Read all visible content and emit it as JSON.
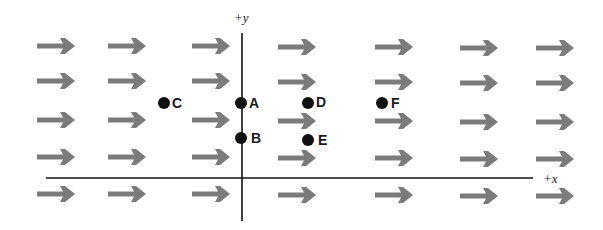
{
  "figure": {
    "axes": {
      "x_label": "+x",
      "y_label": "+y",
      "x_axis": {
        "x1": 46,
        "x2": 533,
        "y": 178
      },
      "y_axis": {
        "x": 242,
        "y1": 33,
        "y2": 221
      },
      "color": "#111111"
    },
    "field": {
      "direction": "+x",
      "arrow_color": "#7b7b7b",
      "arrow_length": 38,
      "columns_x": [
        37,
        108,
        192,
        278,
        375,
        460,
        536
      ],
      "rows_y": [
        46,
        81,
        120,
        157,
        194
      ],
      "column_y_offset": [
        0,
        0,
        0,
        1,
        1,
        2,
        2
      ]
    },
    "points": [
      {
        "label": "A",
        "x": 241,
        "y": 103,
        "label_dx": 8,
        "label_dy": 5
      },
      {
        "label": "B",
        "x": 241,
        "y": 138,
        "label_dx": 10,
        "label_dy": 5
      },
      {
        "label": "C",
        "x": 164,
        "y": 103,
        "label_dx": 8,
        "label_dy": 5
      },
      {
        "label": "D",
        "x": 308,
        "y": 103,
        "label_dx": 8,
        "label_dy": 4
      },
      {
        "label": "E",
        "x": 308,
        "y": 140,
        "label_dx": 10,
        "label_dy": 5
      },
      {
        "label": "F",
        "x": 382,
        "y": 103,
        "label_dx": 9,
        "label_dy": 5
      }
    ],
    "point_color": "#111111",
    "point_radius": 6
  }
}
